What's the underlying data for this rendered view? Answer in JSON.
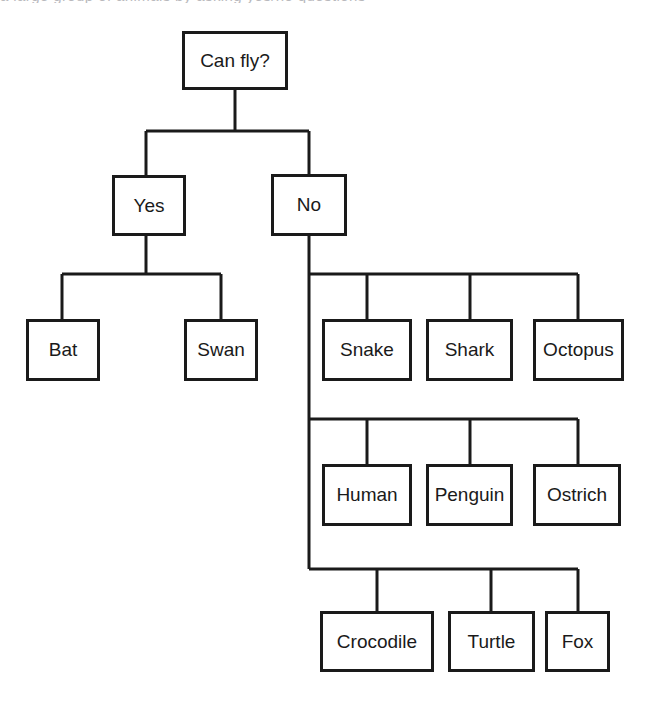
{
  "diagram": {
    "type": "tree-diagram",
    "clipped_text_above": "a large group of animals by asking yes/no questions",
    "style": {
      "background_color": "#ffffff",
      "line_color": "#1a1a1a",
      "box_fill_color": "#ffffff",
      "line_width": 3,
      "font_size": 19
    },
    "nodes": [
      {
        "id": "root",
        "label": "Can fly?",
        "x": 182,
        "y": 31,
        "w": 106,
        "h": 59
      },
      {
        "id": "yes",
        "label": "Yes",
        "x": 112,
        "y": 175,
        "w": 74,
        "h": 61
      },
      {
        "id": "no",
        "label": "No",
        "x": 271,
        "y": 174,
        "w": 76,
        "h": 62
      },
      {
        "id": "bat",
        "label": "Bat",
        "x": 26,
        "y": 319,
        "w": 74,
        "h": 62
      },
      {
        "id": "swan",
        "label": "Swan",
        "x": 184,
        "y": 319,
        "w": 74,
        "h": 62
      },
      {
        "id": "snake",
        "label": "Snake",
        "x": 322,
        "y": 319,
        "w": 90,
        "h": 62
      },
      {
        "id": "shark",
        "label": "Shark",
        "x": 426,
        "y": 319,
        "w": 87,
        "h": 62
      },
      {
        "id": "octopus",
        "label": "Octopus",
        "x": 533,
        "y": 319,
        "w": 91,
        "h": 62
      },
      {
        "id": "human",
        "label": "Human",
        "x": 322,
        "y": 464,
        "w": 90,
        "h": 62
      },
      {
        "id": "penguin",
        "label": "Penguin",
        "x": 426,
        "y": 464,
        "w": 87,
        "h": 62
      },
      {
        "id": "ostrich",
        "label": "Ostrich",
        "x": 533,
        "y": 464,
        "w": 88,
        "h": 62
      },
      {
        "id": "crocodile",
        "label": "Crocodile",
        "x": 320,
        "y": 611,
        "w": 114,
        "h": 61
      },
      {
        "id": "turtle",
        "label": "Turtle",
        "x": 448,
        "y": 611,
        "w": 87,
        "h": 61
      },
      {
        "id": "fox",
        "label": "Fox",
        "x": 545,
        "y": 611,
        "w": 65,
        "h": 61
      }
    ],
    "edges": [
      {
        "id": "root-stem",
        "from": "root",
        "to": "bus-top",
        "x1": 235,
        "y1": 90,
        "x2": 235,
        "y2": 131
      },
      {
        "id": "bus-top",
        "from": "root",
        "to": "yes-no",
        "x1": 146,
        "y1": 131,
        "x2": 309,
        "y2": 131
      },
      {
        "id": "bus-top-to-yes",
        "from": "root",
        "to": "yes",
        "x1": 146,
        "y1": 131,
        "x2": 146,
        "y2": 175
      },
      {
        "id": "bus-top-to-no",
        "from": "root",
        "to": "no",
        "x1": 309,
        "y1": 131,
        "x2": 309,
        "y2": 174
      },
      {
        "id": "yes-stem",
        "from": "yes",
        "to": "bus-yes",
        "x1": 146,
        "y1": 236,
        "x2": 146,
        "y2": 274
      },
      {
        "id": "bus-yes",
        "from": "yes",
        "to": "bat-swan",
        "x1": 62,
        "y1": 274,
        "x2": 221,
        "y2": 274
      },
      {
        "id": "bus-yes-to-bat",
        "from": "yes",
        "to": "bat",
        "x1": 62,
        "y1": 274,
        "x2": 62,
        "y2": 319
      },
      {
        "id": "bus-yes-to-swan",
        "from": "yes",
        "to": "swan",
        "x1": 221,
        "y1": 274,
        "x2": 221,
        "y2": 319
      },
      {
        "id": "no-trunk",
        "from": "no",
        "to": "no-children",
        "x1": 309,
        "y1": 236,
        "x2": 309,
        "y2": 569
      },
      {
        "id": "bus-r1",
        "from": "no",
        "to": "row1",
        "x1": 309,
        "y1": 274,
        "x2": 578,
        "y2": 274
      },
      {
        "id": "bus-r1-snake",
        "from": "no",
        "to": "snake",
        "x1": 367,
        "y1": 274,
        "x2": 367,
        "y2": 319
      },
      {
        "id": "bus-r1-shark",
        "from": "no",
        "to": "shark",
        "x1": 470,
        "y1": 274,
        "x2": 470,
        "y2": 319
      },
      {
        "id": "bus-r1-octopus",
        "from": "no",
        "to": "octopus",
        "x1": 578,
        "y1": 274,
        "x2": 578,
        "y2": 319
      },
      {
        "id": "bus-r2",
        "from": "no",
        "to": "row2",
        "x1": 309,
        "y1": 419,
        "x2": 578,
        "y2": 419
      },
      {
        "id": "bus-r2-human",
        "from": "no",
        "to": "human",
        "x1": 367,
        "y1": 419,
        "x2": 367,
        "y2": 464
      },
      {
        "id": "bus-r2-penguin",
        "from": "no",
        "to": "penguin",
        "x1": 470,
        "y1": 419,
        "x2": 470,
        "y2": 464
      },
      {
        "id": "bus-r2-ostrich",
        "from": "no",
        "to": "ostrich",
        "x1": 578,
        "y1": 419,
        "x2": 578,
        "y2": 464
      },
      {
        "id": "bus-r3",
        "from": "no",
        "to": "row3",
        "x1": 309,
        "y1": 569,
        "x2": 578,
        "y2": 569
      },
      {
        "id": "bus-r3-crocodile",
        "from": "no",
        "to": "crocodile",
        "x1": 377,
        "y1": 569,
        "x2": 377,
        "y2": 611
      },
      {
        "id": "bus-r3-turtle",
        "from": "no",
        "to": "turtle",
        "x1": 491,
        "y1": 569,
        "x2": 491,
        "y2": 611
      },
      {
        "id": "bus-r3-fox",
        "from": "no",
        "to": "fox",
        "x1": 578,
        "y1": 569,
        "x2": 578,
        "y2": 611
      }
    ]
  }
}
